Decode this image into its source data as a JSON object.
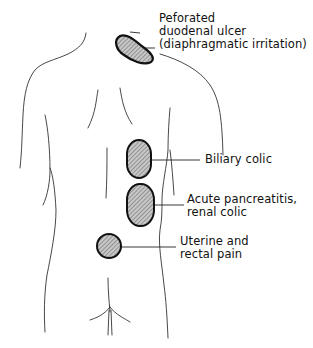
{
  "diagram": {
    "colors": {
      "outline": "#333333",
      "region_stroke": "#111111",
      "region_fill": "#bdbdbd",
      "hatch": "#555555",
      "text": "#111111"
    },
    "regions": [
      {
        "id": "shoulder",
        "label_lines": [
          "Peforated",
          "duodenal ulcer",
          "(diaphragmatic irritation)"
        ],
        "shape": "elongated-oval"
      },
      {
        "id": "biliary",
        "label_lines": [
          "Biliary colic"
        ],
        "shape": "oval"
      },
      {
        "id": "pancreas",
        "label_lines": [
          "Acute pancreatitis,",
          "renal colic"
        ],
        "shape": "oval"
      },
      {
        "id": "sacral",
        "label_lines": [
          "Uterine and",
          "rectal pain"
        ],
        "shape": "circle"
      }
    ]
  }
}
